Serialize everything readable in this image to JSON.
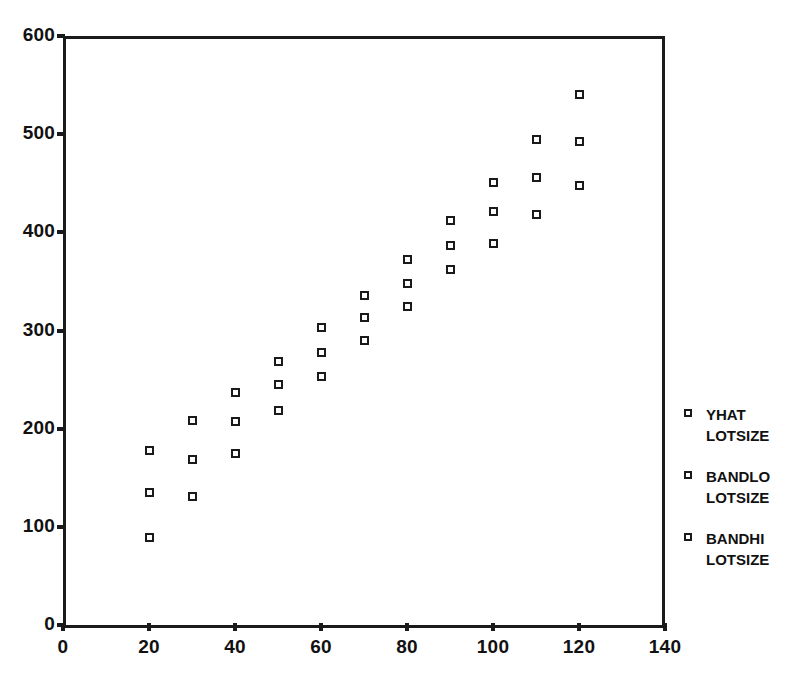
{
  "chart_data": {
    "type": "scatter",
    "title": "",
    "xlabel": "",
    "ylabel": "",
    "xlim": [
      0,
      140
    ],
    "ylim": [
      0,
      600
    ],
    "grid": false,
    "legend_position": "right",
    "xticks": [
      0,
      20,
      40,
      60,
      80,
      100,
      120,
      140
    ],
    "xtick_labels": [
      "0",
      "20",
      "40",
      "60",
      "80",
      "100",
      "120",
      "140"
    ],
    "yticks": [
      0,
      100,
      200,
      300,
      400,
      500,
      600
    ],
    "ytick_labels": [
      "0",
      "100",
      "200",
      "300",
      "400",
      "500",
      "600"
    ],
    "x": [
      20,
      30,
      40,
      50,
      60,
      70,
      80,
      90,
      100,
      110,
      120
    ],
    "series": [
      {
        "name": "BANDHI",
        "legend_label": "BANDHI",
        "legend_sublabel": "LOTSIZE",
        "marker": "open-square",
        "color": "#1a1a1a",
        "values": [
          178,
          208,
          237,
          268,
          303,
          336,
          372,
          412,
          451,
          495,
          540
        ]
      },
      {
        "name": "YHAT",
        "legend_label": "YHAT",
        "legend_sublabel": "LOTSIZE",
        "marker": "open-square",
        "color": "#1a1a1a",
        "values": [
          135,
          169,
          207,
          245,
          278,
          313,
          348,
          387,
          421,
          456,
          493
        ]
      },
      {
        "name": "BANDLO",
        "legend_label": "BANDLO",
        "legend_sublabel": "LOTSIZE",
        "marker": "open-square",
        "color": "#1a1a1a",
        "values": [
          89,
          131,
          175,
          219,
          253,
          290,
          324,
          362,
          389,
          418,
          448
        ]
      }
    ]
  },
  "legend": {
    "entries": [
      {
        "label": "YHAT",
        "sublabel": "LOTSIZE"
      },
      {
        "label": "BANDLO",
        "sublabel": "LOTSIZE"
      },
      {
        "label": "BANDHI",
        "sublabel": "LOTSIZE"
      }
    ]
  },
  "colors": {
    "ink": "#1a1a1a",
    "background": "#ffffff"
  }
}
